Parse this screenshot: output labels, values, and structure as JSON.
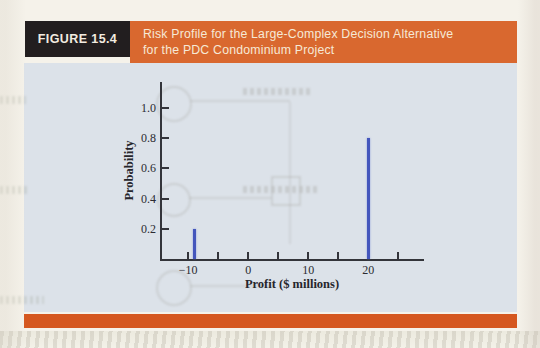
{
  "figure": {
    "label": "FIGURE 15.4",
    "title_line1": "Risk Profile for the Large-Complex Decision Alternative",
    "title_line2": "for the PDC Condominium Project"
  },
  "colors": {
    "banner_orange": "#d9682f",
    "bottom_strip_orange": "#d5571f",
    "label_box_black": "#221e1f",
    "panel_background": "#dce2e9",
    "bar_blue": "#4456bc",
    "axis_color": "#33343a"
  },
  "chart_data": {
    "type": "bar",
    "title": "Risk Profile for the Large-Complex Decision Alternative for the PDC Condominium Project",
    "xlabel": "Profit ($ millions)",
    "ylabel": "Probability",
    "points": [
      {
        "x": -9,
        "probability": 0.2
      },
      {
        "x": 20,
        "probability": 0.8
      }
    ],
    "x_major_ticks": [
      -10,
      0,
      10,
      20
    ],
    "x_minor_ticks": [
      -5,
      5,
      15,
      25
    ],
    "y_ticks": [
      0.2,
      0.4,
      0.6,
      0.8,
      1.0
    ],
    "xlim": [
      -14.7,
      29.3
    ],
    "ylim": [
      0,
      1.172
    ],
    "grid": false,
    "legend_position": "none"
  }
}
